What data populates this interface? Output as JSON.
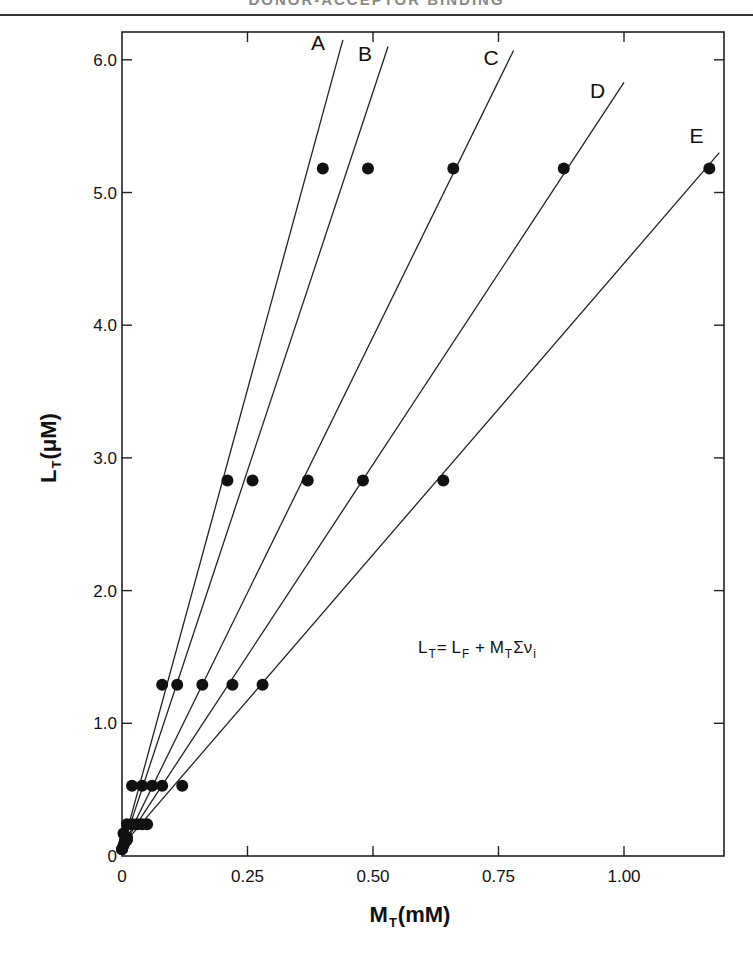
{
  "page": {
    "header_text": "DONOR-ACCEPTOR BINDING"
  },
  "chart_data": {
    "type": "line",
    "title": "",
    "xlabel": "M_T (mM)",
    "ylabel": "L_T (μM)",
    "xlim": [
      0,
      1.2
    ],
    "ylim": [
      0,
      6.2
    ],
    "grid": false,
    "legend": "inline line labels A–E at upper ends of lines",
    "x_ticks": [
      "0",
      "0.25",
      "0.50",
      "0.75",
      "1.00"
    ],
    "y_ticks": [
      "0",
      "1.0",
      "2.0",
      "3.0",
      "4.0",
      "5.0",
      "6.0"
    ],
    "annotation": "L_T = L_F + M_T Σν_i",
    "series": [
      {
        "name": "A",
        "points": [
          [
            0.0,
            0.05
          ],
          [
            0.003,
            0.17
          ],
          [
            0.01,
            0.24
          ],
          [
            0.02,
            0.53
          ],
          [
            0.08,
            1.29
          ],
          [
            0.21,
            2.83
          ],
          [
            0.4,
            5.18
          ]
        ],
        "line_end": [
          0.44,
          6.15
        ]
      },
      {
        "name": "B",
        "points": [
          [
            0.0,
            0.05
          ],
          [
            0.006,
            0.12
          ],
          [
            0.02,
            0.24
          ],
          [
            0.04,
            0.53
          ],
          [
            0.11,
            1.29
          ],
          [
            0.26,
            2.83
          ],
          [
            0.49,
            5.18
          ]
        ],
        "line_end": [
          0.53,
          6.1
        ]
      },
      {
        "name": "C",
        "points": [
          [
            0.003,
            0.08
          ],
          [
            0.01,
            0.14
          ],
          [
            0.03,
            0.24
          ],
          [
            0.06,
            0.53
          ],
          [
            0.16,
            1.29
          ],
          [
            0.37,
            2.83
          ],
          [
            0.66,
            5.18
          ]
        ],
        "line_end": [
          0.78,
          6.07
        ]
      },
      {
        "name": "D",
        "points": [
          [
            0.005,
            0.1
          ],
          [
            0.04,
            0.24
          ],
          [
            0.08,
            0.53
          ],
          [
            0.22,
            1.29
          ],
          [
            0.48,
            2.83
          ],
          [
            0.88,
            5.18
          ]
        ],
        "line_end": [
          1.0,
          5.83
        ]
      },
      {
        "name": "E",
        "points": [
          [
            0.01,
            0.12
          ],
          [
            0.05,
            0.24
          ],
          [
            0.12,
            0.53
          ],
          [
            0.28,
            1.29
          ],
          [
            0.64,
            2.83
          ],
          [
            1.17,
            5.18
          ]
        ],
        "line_end": [
          1.19,
          5.3
        ]
      }
    ]
  },
  "labels": {
    "x_axis_main": "M",
    "x_axis_sub": "T",
    "x_axis_unit": "(mM)",
    "y_axis_main": "L",
    "y_axis_sub": "T",
    "y_axis_unit": "(μM)",
    "eq_lt": "L",
    "eq_lt_sub": "T",
    "eq_equals": "= ",
    "eq_lf": "L",
    "eq_lf_sub": "F",
    "eq_plus": " + ",
    "eq_mt": "M",
    "eq_mt_sub": "T",
    "eq_sum": "Σν",
    "eq_sum_sub": "i"
  }
}
